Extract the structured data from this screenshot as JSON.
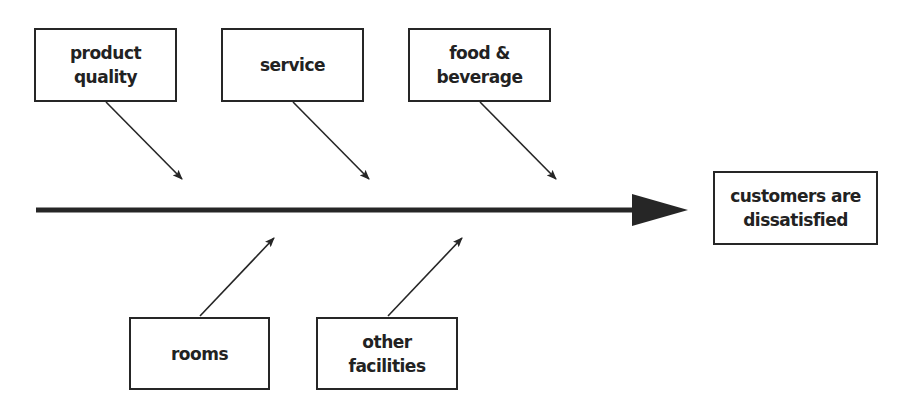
{
  "diagram": {
    "type": "fishbone (cause-and-effect)",
    "effect": {
      "lines": [
        "customers are",
        "dissatisfied"
      ]
    },
    "causes_top": [
      {
        "lines": [
          "product",
          "quality"
        ]
      },
      {
        "lines": [
          "service"
        ]
      },
      {
        "lines": [
          "food &",
          "beverage"
        ]
      }
    ],
    "causes_bottom": [
      {
        "lines": [
          "rooms"
        ]
      },
      {
        "lines": [
          "other",
          "facilities"
        ]
      }
    ],
    "colors": {
      "line": "#262626",
      "text": "#222222",
      "background": "#ffffff"
    }
  }
}
